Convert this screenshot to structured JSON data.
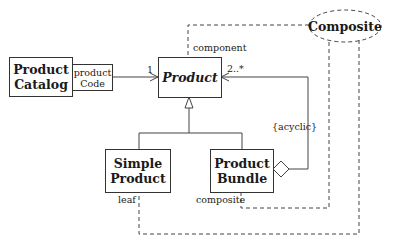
{
  "diagram": {
    "type": "UML class diagram - Composite pattern",
    "collaboration": {
      "name": "Composite"
    },
    "classes": [
      {
        "id": "product_catalog",
        "name": "Product Catalog",
        "lines": [
          "Product",
          "Catalog"
        ]
      },
      {
        "id": "product",
        "name": "Product",
        "abstract": true
      },
      {
        "id": "simple_product",
        "name": "Simple Product",
        "lines": [
          "Simple",
          "Product"
        ]
      },
      {
        "id": "product_bundle",
        "name": "Product Bundle",
        "lines": [
          "Product",
          "Bundle"
        ]
      }
    ],
    "qualifier": {
      "lines": [
        "product",
        "Code"
      ]
    },
    "associations": [
      {
        "from": "Product Catalog",
        "to": "Product",
        "qualifier": "productCode",
        "multiplicity": "1"
      },
      {
        "from": "Product Bundle",
        "to": "Product",
        "kind": "aggregation",
        "multiplicity": "2..*",
        "constraint": "{acyclic}"
      }
    ],
    "generalizations": [
      {
        "child": "Simple Product",
        "parent": "Product"
      },
      {
        "child": "Product Bundle",
        "parent": "Product"
      }
    ],
    "roles": [
      {
        "role": "component",
        "bound_to": "Product"
      },
      {
        "role": "leaf",
        "bound_to": "Simple Product"
      },
      {
        "role": "composite",
        "bound_to": "Product Bundle"
      }
    ],
    "labels": {
      "multiplicity_one": "1",
      "multiplicity_many": "2..*",
      "constraint": "{acyclic}",
      "role_component": "component",
      "role_leaf": "leaf",
      "role_composite": "composite"
    }
  }
}
